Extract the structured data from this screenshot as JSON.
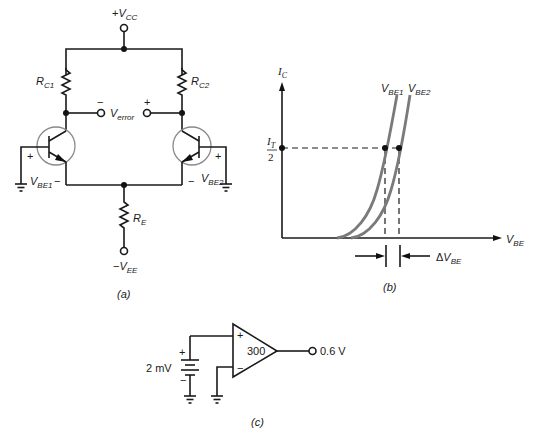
{
  "figure": {
    "a": {
      "caption": "(a)",
      "vcc": {
        "sign": "+",
        "main": "V",
        "sub": "CC"
      },
      "vee": {
        "sign": "−",
        "main": "V",
        "sub": "EE"
      },
      "rc1": {
        "main": "R",
        "sub": "C1"
      },
      "rc2": {
        "main": "R",
        "sub": "C2"
      },
      "re": {
        "main": "R",
        "sub": "E"
      },
      "verror": {
        "main": "V",
        "sub": "error",
        "minus": "−",
        "plus": "+"
      },
      "vbe1": {
        "main": "V",
        "sub": "BE1",
        "plus": "+",
        "minus": "−"
      },
      "vbe2": {
        "main": "V",
        "sub": "BE2",
        "plus": "+",
        "minus": "−"
      }
    },
    "b": {
      "caption": "(b)",
      "y_axis": {
        "main": "I",
        "sub": "C"
      },
      "x_axis": {
        "main": "V",
        "sub": "BE"
      },
      "level": {
        "num": "I",
        "num_sub": "T",
        "den": "2"
      },
      "curve1": {
        "main": "V",
        "sub": "BE1"
      },
      "curve2": {
        "main": "V",
        "sub": "BE2"
      },
      "delta": {
        "prefix": "Δ",
        "main": "V",
        "sub": "BE"
      }
    },
    "c": {
      "caption": "(c)",
      "source": "2 mV",
      "source_plus": "+",
      "source_minus": "−",
      "gain": "300",
      "output": "0.6 V",
      "in_plus": "+",
      "in_minus": "−"
    }
  }
}
